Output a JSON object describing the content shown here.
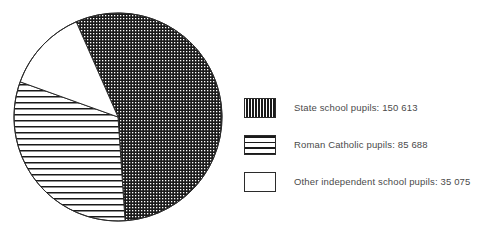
{
  "chart_data": {
    "type": "pie",
    "title": "",
    "subtitle": "",
    "xlabel": "",
    "ylabel": "",
    "categories": [
      "State school pupils",
      "Roman Catholic pupils",
      "Other independent school pupils"
    ],
    "values": [
      150613,
      85688,
      35075
    ],
    "total": 271376,
    "percentages": [
      55.5,
      31.6,
      12.9
    ],
    "start_angle_deg": -23.7,
    "direction": "clockwise",
    "legend_position": "right",
    "grid": false,
    "slices": [
      {
        "label": "State school pupils",
        "value": 150613,
        "value_text": "150 613",
        "legend_text": "State school pupils: 150 613",
        "percent": 55.5,
        "angle_deg": 199.8,
        "fill_pattern": "dense-dot",
        "fill_color": "#1a1a1a",
        "pattern_color": "#ffffff"
      },
      {
        "label": "Roman Catholic pupils",
        "value": 85688,
        "value_text": "85 688",
        "legend_text": "Roman Catholic pupils: 85 688",
        "percent": 31.6,
        "angle_deg": 113.6,
        "fill_pattern": "horizontal-lines",
        "fill_color": "#ffffff",
        "pattern_color": "#1a1a1a"
      },
      {
        "label": "Other independent school pupils",
        "value": 35075,
        "value_text": "35 075",
        "legend_text": "Other independent school pupils: 35 075",
        "percent": 12.9,
        "angle_deg": 46.5,
        "fill_pattern": "solid-white",
        "fill_color": "#ffffff",
        "pattern_color": "#1a1a1a"
      }
    ],
    "geometry": {
      "center_x": 118,
      "center_y": 117,
      "radius": 104
    },
    "colors": {
      "outline": "#2b2b2b",
      "text": "#4a4a4a",
      "background": "#ffffff"
    }
  },
  "legend": {
    "entries": [
      {
        "text": "State school pupils: 150 613",
        "swatch": "dense-dot-swatch"
      },
      {
        "text": "Roman Catholic pupils: 85 688",
        "swatch": "horizontal-lines-swatch"
      },
      {
        "text": "Other independent school pupils: 35 075",
        "swatch": "empty-swatch"
      }
    ]
  }
}
